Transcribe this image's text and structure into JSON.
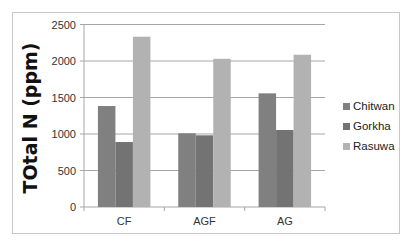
{
  "chart_data": {
    "type": "bar",
    "title": "",
    "xlabel": "",
    "ylabel": "TOtal N (ppm)",
    "categories": [
      "CF",
      "AGF",
      "AG"
    ],
    "series": [
      {
        "name": "Chitwan",
        "color": "#808080",
        "values": [
          1383,
          1010,
          1557
        ]
      },
      {
        "name": "Gorkha",
        "color": "#737373",
        "values": [
          890,
          982,
          1055
        ]
      },
      {
        "name": "Rasuwa",
        "color": "#b2b2b2",
        "values": [
          2333,
          2030,
          2086
        ]
      }
    ],
    "ylim": [
      0,
      2500
    ],
    "yticks": [
      0,
      500,
      1000,
      1500,
      2000,
      2500
    ],
    "grid": true,
    "legend_position": "right"
  }
}
